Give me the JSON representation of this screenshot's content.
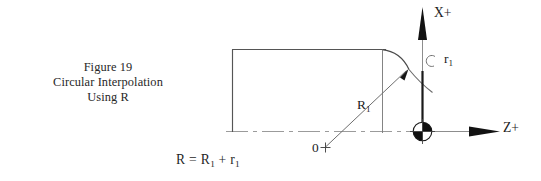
{
  "figure": {
    "caption_lines": [
      "Figure 19",
      "Circular Interpolation",
      "Using R"
    ],
    "formula": {
      "left": "R",
      "equals": "=",
      "term1_base": "R",
      "term1_sub": "1",
      "plus": "+",
      "term2_base": "r",
      "term2_sub": "1"
    }
  },
  "axes": {
    "x_axis_label": "X+",
    "z_axis_label": "Z+",
    "origin_label": "0",
    "origin_marker": "plus-cross-mark",
    "datum_symbol": "quartered-circle-datum"
  },
  "dimensions": {
    "major_radius_base": "R",
    "major_radius_sub": "1",
    "minor_radius_base": "r",
    "minor_radius_sub": "1"
  },
  "geometry": {
    "workpiece_outline": "rectangle-profile",
    "centerline": "dash-dot-centerline",
    "blend_arc": "tangent-corner-arc",
    "radius_leader": "r1-leader-line",
    "r1_arc_symbol": "small-arc-marker"
  },
  "colors": {
    "background": "#ffffff",
    "ink": "#1c1c1c",
    "line": "#4a4a4a",
    "light_line": "#9a9a9a",
    "datum_fill": "#111111"
  }
}
